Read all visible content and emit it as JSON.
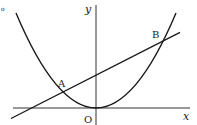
{
  "diagram": {
    "type": "coordinate-graph",
    "labels": {
      "y_axis": "y",
      "x_axis": "x",
      "origin": "O",
      "point_a": "A",
      "point_b": "B",
      "corner_mark": "o"
    },
    "colors": {
      "stroke": "#1a1a1a",
      "axis": "#333333",
      "background": "#ffffff"
    },
    "elements": [
      {
        "kind": "axis",
        "name": "x-axis"
      },
      {
        "kind": "axis",
        "name": "y-axis"
      },
      {
        "kind": "curve",
        "name": "parabola",
        "vertex": "O"
      },
      {
        "kind": "line",
        "name": "line-AB",
        "passes_through": [
          "A",
          "B"
        ]
      },
      {
        "kind": "point",
        "name": "A",
        "position": "left intersection"
      },
      {
        "kind": "point",
        "name": "B",
        "position": "right intersection"
      }
    ]
  }
}
